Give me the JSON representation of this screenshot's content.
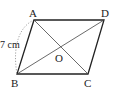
{
  "diagram": {
    "type": "parallelogram",
    "vertices": {
      "A": {
        "label": "A",
        "x": 34,
        "y": 20
      },
      "D": {
        "label": "D",
        "x": 104,
        "y": 20
      },
      "B": {
        "label": "B",
        "x": 17,
        "y": 74
      },
      "C": {
        "label": "C",
        "x": 88,
        "y": 74
      },
      "O": {
        "label": "O",
        "x": 60,
        "y": 47
      }
    },
    "measurement": {
      "segment": "AB",
      "label": "7 cm"
    },
    "colors": {
      "stroke": "#222222",
      "diagonal": "#444444",
      "dotted": "#999999"
    }
  }
}
